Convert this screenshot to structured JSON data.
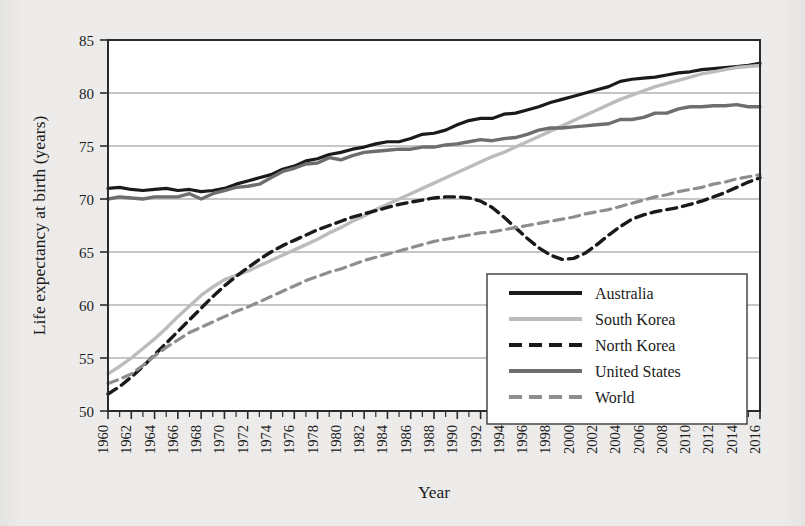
{
  "chart_data": {
    "type": "line",
    "title": "",
    "xlabel": "Year",
    "ylabel": "Life expectancy at birth (years)",
    "xlim": [
      1960,
      2016
    ],
    "ylim": [
      50,
      85
    ],
    "yticks": [
      50,
      55,
      60,
      65,
      70,
      75,
      80,
      85
    ],
    "xticks": [
      1960,
      1962,
      1964,
      1966,
      1968,
      1970,
      1972,
      1974,
      1976,
      1978,
      1980,
      1982,
      1984,
      1986,
      1988,
      1990,
      1992,
      1994,
      1996,
      1998,
      2000,
      2002,
      2004,
      2006,
      2008,
      2010,
      2012,
      2014,
      2016
    ],
    "xticks_minor_step": 1,
    "grid": "horizontal",
    "legend_position": "lower-right-inside",
    "x": [
      1960,
      1961,
      1962,
      1963,
      1964,
      1965,
      1966,
      1967,
      1968,
      1969,
      1970,
      1971,
      1972,
      1973,
      1974,
      1975,
      1976,
      1977,
      1978,
      1979,
      1980,
      1981,
      1982,
      1983,
      1984,
      1985,
      1986,
      1987,
      1988,
      1989,
      1990,
      1991,
      1992,
      1993,
      1994,
      1995,
      1996,
      1997,
      1998,
      1999,
      2000,
      2001,
      2002,
      2003,
      2004,
      2005,
      2006,
      2007,
      2008,
      2009,
      2010,
      2011,
      2012,
      2013,
      2014,
      2015,
      2016
    ],
    "series": [
      {
        "name": "Australia",
        "color": "#1a1a1a",
        "style": "solid",
        "width": 3.2,
        "values": [
          71.0,
          71.1,
          70.9,
          70.8,
          70.9,
          71.0,
          70.8,
          70.9,
          70.7,
          70.8,
          71.0,
          71.4,
          71.7,
          72.0,
          72.3,
          72.8,
          73.1,
          73.6,
          73.8,
          74.2,
          74.4,
          74.7,
          74.9,
          75.2,
          75.4,
          75.4,
          75.7,
          76.1,
          76.2,
          76.5,
          77.0,
          77.4,
          77.6,
          77.6,
          78.0,
          78.1,
          78.4,
          78.7,
          79.1,
          79.4,
          79.7,
          80.0,
          80.3,
          80.6,
          81.1,
          81.3,
          81.4,
          81.5,
          81.7,
          81.9,
          82.0,
          82.2,
          82.3,
          82.4,
          82.5,
          82.6,
          82.8
        ]
      },
      {
        "name": "South Korea",
        "color": "#bcbcbc",
        "style": "solid",
        "width": 3.4,
        "values": [
          53.5,
          54.2,
          55.0,
          55.9,
          56.8,
          57.8,
          58.9,
          59.9,
          60.9,
          61.7,
          62.4,
          62.8,
          63.2,
          63.7,
          64.2,
          64.7,
          65.2,
          65.7,
          66.2,
          66.8,
          67.3,
          67.9,
          68.4,
          69.0,
          69.5,
          70.0,
          70.5,
          71.0,
          71.5,
          72.0,
          72.5,
          73.0,
          73.5,
          74.0,
          74.4,
          74.9,
          75.4,
          75.9,
          76.4,
          76.9,
          77.4,
          77.9,
          78.4,
          78.9,
          79.4,
          79.8,
          80.2,
          80.6,
          80.9,
          81.2,
          81.5,
          81.8,
          82.0,
          82.2,
          82.4,
          82.5,
          82.6
        ]
      },
      {
        "name": "North Korea",
        "color": "#1a1a1a",
        "style": "dashed",
        "width": 3.4,
        "values": [
          51.6,
          52.3,
          53.2,
          54.2,
          55.3,
          56.4,
          57.5,
          58.6,
          59.7,
          60.8,
          61.8,
          62.7,
          63.5,
          64.3,
          65.0,
          65.6,
          66.1,
          66.6,
          67.1,
          67.5,
          67.9,
          68.3,
          68.6,
          68.9,
          69.2,
          69.5,
          69.7,
          69.9,
          70.1,
          70.2,
          70.2,
          70.1,
          69.8,
          69.2,
          68.3,
          67.3,
          66.3,
          65.4,
          64.7,
          64.3,
          64.4,
          64.9,
          65.7,
          66.6,
          67.4,
          68.1,
          68.5,
          68.8,
          69.0,
          69.2,
          69.5,
          69.8,
          70.2,
          70.6,
          71.1,
          71.6,
          72.0
        ]
      },
      {
        "name": "United States",
        "color": "#6e6e6e",
        "style": "solid",
        "width": 3.4,
        "values": [
          70.0,
          70.2,
          70.1,
          70.0,
          70.2,
          70.2,
          70.2,
          70.5,
          70.0,
          70.5,
          70.8,
          71.1,
          71.2,
          71.4,
          72.0,
          72.6,
          72.9,
          73.3,
          73.4,
          73.9,
          73.7,
          74.1,
          74.4,
          74.5,
          74.6,
          74.7,
          74.7,
          74.9,
          74.9,
          75.1,
          75.2,
          75.4,
          75.6,
          75.5,
          75.7,
          75.8,
          76.1,
          76.5,
          76.7,
          76.7,
          76.8,
          76.9,
          77.0,
          77.1,
          77.5,
          77.5,
          77.7,
          78.1,
          78.1,
          78.5,
          78.7,
          78.7,
          78.8,
          78.8,
          78.9,
          78.7,
          78.7
        ]
      },
      {
        "name": "World",
        "color": "#8e8e8e",
        "style": "dashed",
        "width": 3.2,
        "values": [
          52.6,
          53.0,
          53.5,
          54.3,
          55.2,
          56.0,
          56.7,
          57.4,
          57.9,
          58.4,
          58.9,
          59.4,
          59.8,
          60.3,
          60.8,
          61.3,
          61.8,
          62.3,
          62.7,
          63.1,
          63.4,
          63.8,
          64.2,
          64.5,
          64.8,
          65.1,
          65.4,
          65.7,
          66.0,
          66.2,
          66.4,
          66.6,
          66.8,
          66.9,
          67.1,
          67.3,
          67.5,
          67.7,
          67.9,
          68.1,
          68.3,
          68.6,
          68.8,
          69.0,
          69.3,
          69.6,
          69.9,
          70.2,
          70.4,
          70.7,
          70.9,
          71.1,
          71.4,
          71.6,
          71.9,
          72.1,
          72.3
        ]
      }
    ]
  },
  "axes": {
    "y_title": "Life expectancy at birth (years)",
    "x_title": "Year",
    "y_tick_labels": [
      "85",
      "80",
      "75",
      "70",
      "65",
      "60",
      "55",
      "50"
    ],
    "x_tick_labels": [
      "1960",
      "1962",
      "1964",
      "1966",
      "1968",
      "1970",
      "1972",
      "1974",
      "1976",
      "1978",
      "1980",
      "1982",
      "1984",
      "1986",
      "1988",
      "1990",
      "1992",
      "1994",
      "1996",
      "1998",
      "2000",
      "2002",
      "2004",
      "2006",
      "2008",
      "2010",
      "2012",
      "2014",
      "2016"
    ]
  },
  "legend": {
    "entries": [
      {
        "label": "Australia",
        "color": "#1a1a1a",
        "style": "solid"
      },
      {
        "label": "South Korea",
        "color": "#bcbcbc",
        "style": "solid"
      },
      {
        "label": "North Korea",
        "color": "#1a1a1a",
        "style": "dashed"
      },
      {
        "label": "United States",
        "color": "#6e6e6e",
        "style": "solid"
      },
      {
        "label": "World",
        "color": "#8e8e8e",
        "style": "dashed"
      }
    ]
  },
  "style": {
    "page_background": "#edecea",
    "plot_background": "#ffffff",
    "frame_color": "#2a2a2a",
    "grid_color": "#8d8d8d",
    "text_color": "#1b1b1b"
  }
}
